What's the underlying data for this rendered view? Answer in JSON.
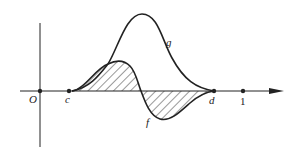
{
  "diagram": {
    "type": "function-graph",
    "curves": [
      {
        "name": "g",
        "label": "g",
        "description": "bell-shaped curve, nonnegative on [c,d], peak above x-axis"
      },
      {
        "name": "f",
        "label": "f",
        "description": "oscillating curve, positive then negative on [c,d]"
      }
    ],
    "axis_points": [
      {
        "name": "origin",
        "label": "O"
      },
      {
        "name": "c",
        "label": "c"
      },
      {
        "name": "d",
        "label": "d"
      },
      {
        "name": "one",
        "label": "1"
      }
    ],
    "shading": "region between curve f and the x-axis, hatched",
    "colors": {
      "ink": "#222222",
      "background": "#ffffff"
    }
  }
}
